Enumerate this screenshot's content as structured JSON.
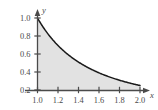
{
  "chart_data": {
    "type": "area",
    "title": "",
    "subtitle": "",
    "xlabel": "x",
    "ylabel": "y",
    "xlim": [
      0.9,
      2.08
    ],
    "ylim": [
      0.17,
      1.06
    ],
    "grid": false,
    "legend": null,
    "annotations": [],
    "xticks": [
      "1.0",
      "1.2",
      "1.4",
      "1.6",
      "1.8",
      "2.0"
    ],
    "xtick_values": [
      1.0,
      1.2,
      1.4,
      1.6,
      1.8,
      2.0
    ],
    "yticks": [
      "0.2",
      "0.4",
      "0.6",
      "0.8",
      "1.0"
    ],
    "ytick_values": [
      0.2,
      0.4,
      0.6,
      0.8,
      1.0
    ],
    "series": [
      {
        "name": "y = 1/x^2",
        "shaded": true,
        "shade_color": "#e2e2e2",
        "line_color": "#1a1a1a",
        "x": [
          1.0,
          1.1,
          1.2,
          1.3,
          1.4,
          1.5,
          1.6,
          1.7,
          1.8,
          1.9,
          2.0
        ],
        "values": [
          1.0,
          0.826,
          0.694,
          0.592,
          0.51,
          0.444,
          0.391,
          0.346,
          0.309,
          0.277,
          0.25
        ]
      }
    ],
    "shade_region": {
      "x_start": 1.0,
      "x_end": 2.0,
      "y_baseline": 0.2,
      "color": "#e2e2e2"
    },
    "axis_color": "#4a4a4a",
    "axis_arrows": true
  },
  "figure": {
    "x_axis_name": "x",
    "y_axis_name": "y"
  }
}
